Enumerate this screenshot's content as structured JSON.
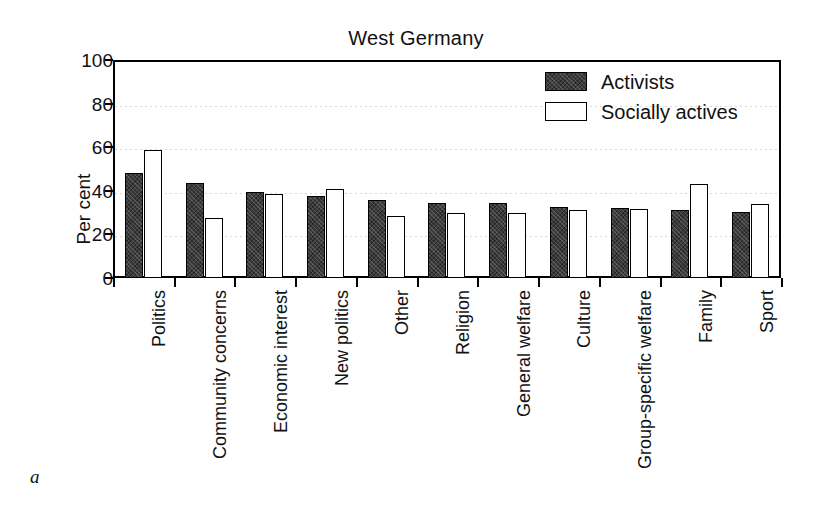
{
  "figure": {
    "caption_letter": "a",
    "title": "West Germany"
  },
  "legend": {
    "position": "top-right",
    "entries": [
      {
        "label": "Activists",
        "swatch": "filled-dark-swatch",
        "color": "#3b3b3b"
      },
      {
        "label": "Socially actives",
        "swatch": "outlined-white-swatch",
        "color": "#ffffff"
      }
    ]
  },
  "axes": {
    "ylabel": "Per cent",
    "yticks": [
      "0",
      "20",
      "40",
      "60",
      "80",
      "100"
    ],
    "ymin": 0,
    "ymax": 100
  },
  "chart_data": {
    "type": "bar",
    "title": "West Germany",
    "xlabel": "",
    "ylabel": "Per cent",
    "ylim": [
      0,
      100
    ],
    "grid": true,
    "legend_position": "top-right",
    "categories": [
      "Politics",
      "Community concerns",
      "Economic interest",
      "New politics",
      "Other",
      "Religion",
      "General welfare",
      "Culture",
      "Group-specific welfare",
      "Family",
      "Sport"
    ],
    "series": [
      {
        "name": "Activists",
        "color": "#3b3b3b",
        "values": [
          48,
          43.5,
          39.5,
          37.5,
          36,
          34.5,
          34.5,
          32.5,
          32,
          31,
          30.5
        ]
      },
      {
        "name": "Socially actives",
        "color": "#ffffff",
        "values": [
          58.5,
          27.5,
          38.5,
          41,
          28.5,
          30,
          30,
          31,
          31.5,
          43,
          34
        ]
      }
    ]
  }
}
